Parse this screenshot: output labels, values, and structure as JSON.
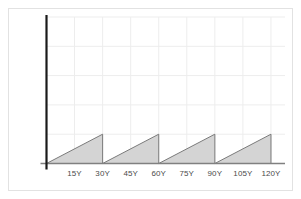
{
  "figure": {
    "name": "sawtooth-waveform-chart",
    "background_color": "#ffffff",
    "border_color": "#e2e2e2"
  },
  "chart_data": {
    "type": "area",
    "title": "",
    "subtitle": "",
    "xlabel": "",
    "ylabel": "",
    "grid": true,
    "legend": false,
    "legend_position": "none",
    "xlim": [
      0,
      127.5
    ],
    "ylim": [
      0,
      5
    ],
    "xtick_labels": [
      "15Y",
      "30Y",
      "45Y",
      "60Y",
      "75Y",
      "90Y",
      "105Y",
      "120Y"
    ],
    "xtick_values": [
      15,
      30,
      45,
      60,
      75,
      90,
      105,
      120
    ],
    "ytick_labels": [],
    "ytick_values": [
      1,
      2,
      3,
      4,
      5
    ],
    "series": [
      {
        "name": "sawtooth",
        "fill_color": "#d4d4d4",
        "line_color": "#7a7a7a",
        "x": [
          0,
          30,
          30,
          60,
          60,
          90,
          90,
          120,
          120
        ],
        "y": [
          0,
          1,
          0,
          1,
          0,
          1,
          0,
          1,
          0
        ]
      }
    ],
    "cycles": [
      {
        "start": 0,
        "peak": 30,
        "peak_value": 1
      },
      {
        "start": 30,
        "peak": 60,
        "peak_value": 1
      },
      {
        "start": 60,
        "peak": 90,
        "peak_value": 1
      },
      {
        "start": 90,
        "peak": 120,
        "peak_value": 1
      }
    ],
    "period_years": 30,
    "colors": {
      "fill": "#d4d4d4",
      "stroke": "#7a7a7a",
      "yaxis": "#1a1a1a",
      "xaxis": "#808080",
      "gridline": "#ededed"
    }
  }
}
